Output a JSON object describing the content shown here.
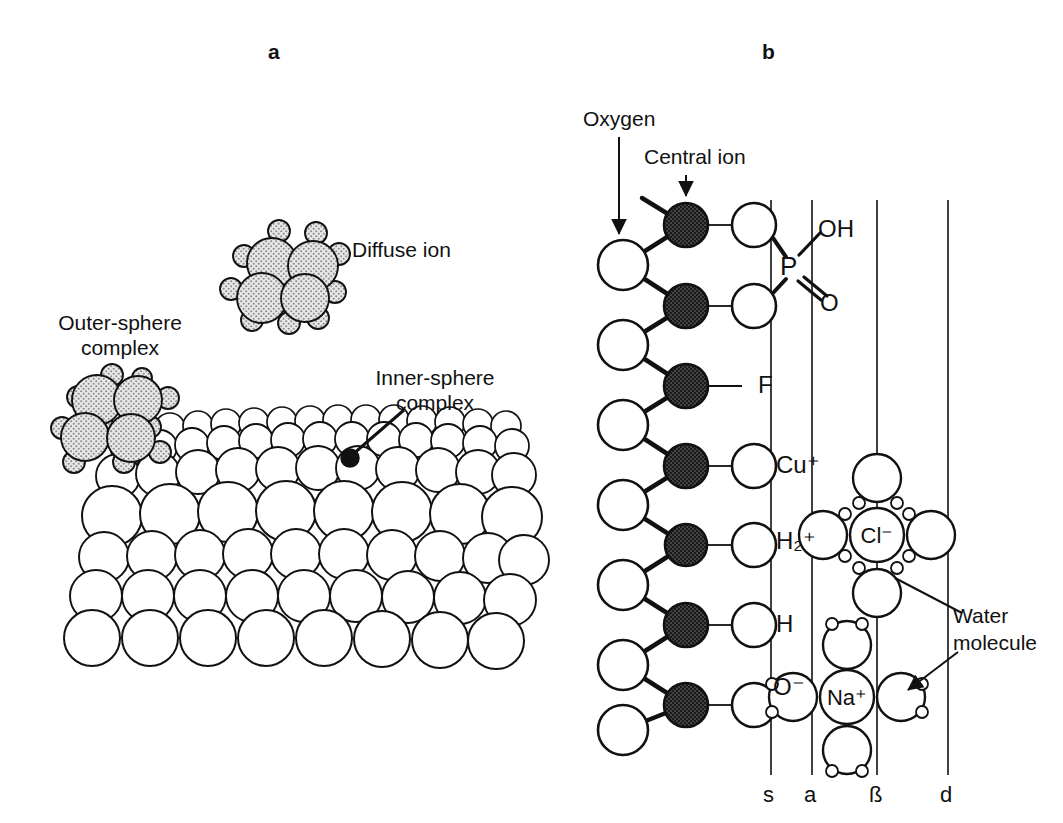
{
  "figure": {
    "panels": [
      {
        "letter": "a",
        "name": "surface-complexation-schematic",
        "labels": [
          {
            "id": "diffuse-ion",
            "text": "Diffuse ion"
          },
          {
            "id": "outer-sphere-complex",
            "text": "Outer-sphere\ncomplex"
          },
          {
            "id": "inner-sphere-complex",
            "text": "Inner-sphere\ncomplex"
          }
        ]
      },
      {
        "letter": "b",
        "name": "interface-plane-schematic",
        "labels": [
          {
            "id": "oxygen",
            "text": "Oxygen"
          },
          {
            "id": "central-ion",
            "text": "Central ion"
          },
          {
            "id": "water-molecule",
            "text": "Water\nmolecule"
          }
        ],
        "chain_species": [
          "OH",
          "O",
          "F",
          "Cu⁺",
          "H₂⁺",
          "H",
          "O⁻"
        ],
        "phosphate": {
          "center_atom": "P",
          "hydroxyl": "OH",
          "double_bond_oxygen": "O"
        },
        "hydrated_ions": [
          {
            "id": "chloride",
            "label": "Cl⁻",
            "waters": 4,
            "hydrogens_face": "inward"
          },
          {
            "id": "sodium",
            "label": "Na⁺",
            "waters": 4,
            "hydrogens_face": "outward"
          }
        ],
        "plane_axis": {
          "ticks": [
            {
              "id": "s-plane",
              "label": "s",
              "x": 771
            },
            {
              "id": "a-plane",
              "label": "a",
              "x": 812
            },
            {
              "id": "beta-plane",
              "label": "ß",
              "x": 877
            },
            {
              "id": "d-plane",
              "label": "d",
              "x": 948
            }
          ]
        }
      }
    ]
  },
  "colors": {
    "ink": "#111111",
    "paper": "#ffffff",
    "stipple_fill": "#cfcfcf",
    "central_ion_fill": "#1a1a1a"
  }
}
